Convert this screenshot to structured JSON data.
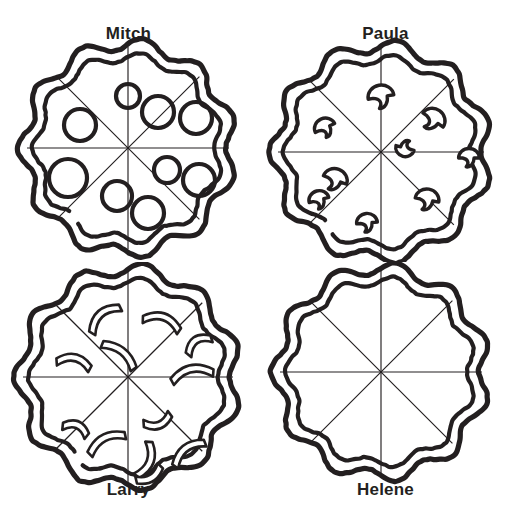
{
  "worksheet": {
    "background_color": "#ffffff",
    "ink_color": "#231f20",
    "layout": "2x2 grid of sliced pizzas",
    "grid": {
      "columns": 2,
      "rows": 2
    }
  },
  "pizzas": [
    {
      "id": "mitch",
      "name": "Mitch",
      "label_position": "top",
      "slices": 8,
      "topping_name": "pepperoni",
      "topping_icon": "pepperoni-circle-icon",
      "topping_count": 8,
      "cell": {
        "col": 0,
        "row": 0
      },
      "center": {
        "x": 128,
        "y": 148
      },
      "radius": 104,
      "toppings": [
        {
          "x": 128,
          "y": 96,
          "r": 12
        },
        {
          "x": 80,
          "y": 125,
          "r": 16
        },
        {
          "x": 158,
          "y": 112,
          "r": 16
        },
        {
          "x": 196,
          "y": 118,
          "r": 16
        },
        {
          "x": 68,
          "y": 178,
          "r": 19
        },
        {
          "x": 117,
          "y": 196,
          "r": 15
        },
        {
          "x": 167,
          "y": 170,
          "r": 13
        },
        {
          "x": 199,
          "y": 180,
          "r": 16
        },
        {
          "x": 148,
          "y": 213,
          "r": 16
        }
      ]
    },
    {
      "id": "paula",
      "name": "Paula",
      "label_position": "top",
      "slices": 8,
      "topping_name": "mushrooms",
      "topping_icon": "mushroom-icon",
      "topping_count": 8,
      "cell": {
        "col": 1,
        "row": 0
      },
      "center": {
        "x": 124,
        "y": 152
      },
      "radius": 106,
      "toppings": [
        {
          "x": 124,
          "y": 97,
          "s": 1.0,
          "rot": -10
        },
        {
          "x": 68,
          "y": 128,
          "s": 0.82,
          "rot": -25
        },
        {
          "x": 176,
          "y": 120,
          "s": 0.95,
          "rot": 35
        },
        {
          "x": 148,
          "y": 148,
          "s": 0.72,
          "rot": 195
        },
        {
          "x": 212,
          "y": 158,
          "s": 0.8,
          "rot": 0
        },
        {
          "x": 78,
          "y": 180,
          "s": 0.95,
          "rot": 20
        },
        {
          "x": 62,
          "y": 200,
          "s": 0.78,
          "rot": -15
        },
        {
          "x": 170,
          "y": 200,
          "s": 0.92,
          "rot": 10
        },
        {
          "x": 110,
          "y": 223,
          "s": 0.8,
          "rot": -5
        }
      ]
    },
    {
      "id": "larry",
      "name": "Larry",
      "label_position": "bottom",
      "slices": 8,
      "topping_name": "green pepper strips",
      "topping_icon": "pepper-strip-icon",
      "topping_count": 12,
      "cell": {
        "col": 0,
        "row": 1
      },
      "center": {
        "x": 128,
        "y": 115
      },
      "radius": 108,
      "toppings": [
        {
          "x": 104,
          "y": 56,
          "len": 40,
          "rot": -42,
          "curve": 18
        },
        {
          "x": 162,
          "y": 60,
          "len": 40,
          "rot": 18,
          "curve": 18
        },
        {
          "x": 74,
          "y": 100,
          "len": 36,
          "rot": 12,
          "curve": 16
        },
        {
          "x": 120,
          "y": 92,
          "len": 42,
          "rot": 38,
          "curve": 14
        },
        {
          "x": 198,
          "y": 82,
          "len": 30,
          "rot": -35,
          "curve": 16
        },
        {
          "x": 192,
          "y": 112,
          "len": 44,
          "rot": -12,
          "curve": 18
        },
        {
          "x": 76,
          "y": 166,
          "len": 28,
          "rot": 22,
          "curve": 14
        },
        {
          "x": 106,
          "y": 180,
          "len": 42,
          "rot": -28,
          "curve": 16
        },
        {
          "x": 158,
          "y": 160,
          "len": 30,
          "rot": 160,
          "curve": 14
        },
        {
          "x": 146,
          "y": 198,
          "len": 38,
          "rot": 110,
          "curve": 16
        },
        {
          "x": 188,
          "y": 190,
          "len": 40,
          "rot": -38,
          "curve": 16
        },
        {
          "x": 150,
          "y": 214,
          "len": 30,
          "rot": 150,
          "curve": 12
        }
      ]
    },
    {
      "id": "helene",
      "name": "Helene",
      "label_position": "bottom",
      "slices": 8,
      "topping_name": "none (plain cheese)",
      "topping_icon": "none",
      "topping_count": 0,
      "cell": {
        "col": 1,
        "row": 1
      },
      "center": {
        "x": 124,
        "y": 110
      },
      "radius": 104,
      "toppings": []
    }
  ]
}
